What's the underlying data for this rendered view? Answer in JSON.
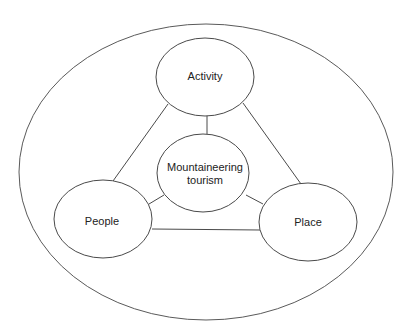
{
  "diagram": {
    "type": "concept-diagram",
    "colors": {
      "stroke": "#4a4a4a",
      "text": "#222222",
      "background": "#ffffff"
    },
    "center_node": {
      "line1": "Mountaineering",
      "line2": "tourism"
    },
    "nodes": {
      "activity": "Activity",
      "people": "People",
      "place": "Place"
    },
    "edges": [
      [
        "Activity",
        "People"
      ],
      [
        "Activity",
        "Place"
      ],
      [
        "People",
        "Place"
      ],
      [
        "Mountaineering tourism",
        "Activity"
      ],
      [
        "Mountaineering tourism",
        "People"
      ],
      [
        "Mountaineering tourism",
        "Place"
      ]
    ]
  }
}
